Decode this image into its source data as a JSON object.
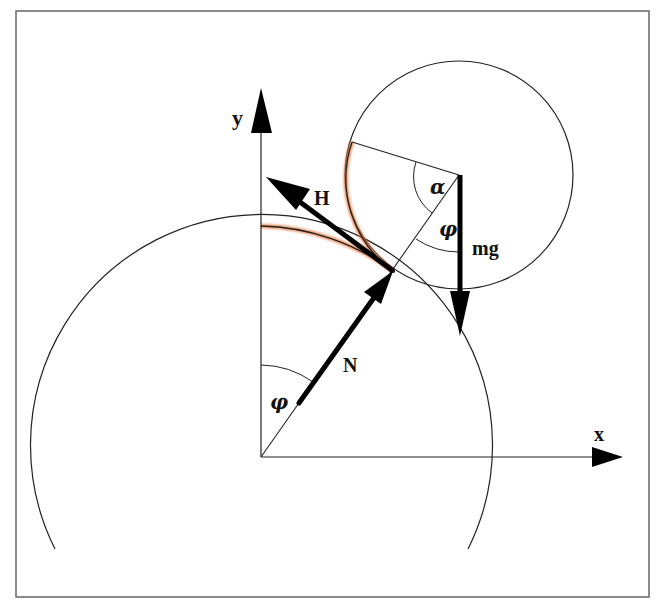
{
  "diagram": {
    "colors": {
      "line": "#222222",
      "frame": "#666666",
      "highlight": "#d9542b",
      "background": "#ffffff"
    },
    "axes": {
      "x_label": "x",
      "y_label": "y"
    },
    "forces": {
      "H": "H",
      "N": "N",
      "mg": "mg"
    },
    "angles": {
      "alpha": "α",
      "phi_top": "φ",
      "phi_bottom": "φ"
    }
  }
}
